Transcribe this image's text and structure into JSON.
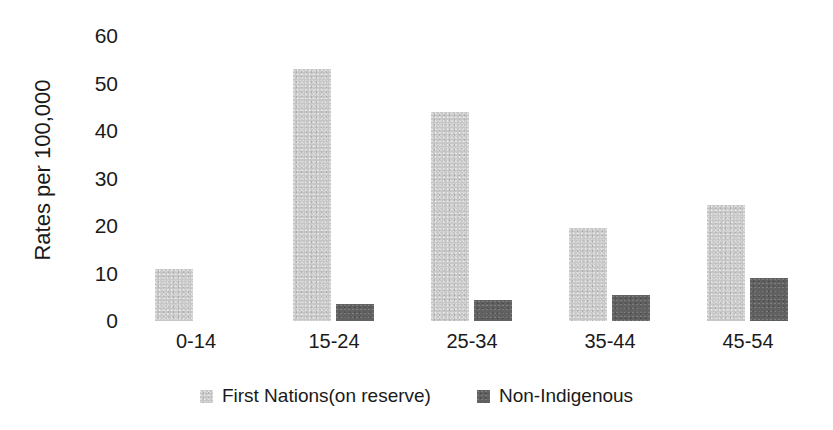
{
  "chart_data": {
    "type": "bar",
    "title": "",
    "subtitle": "",
    "xlabel": "",
    "ylabel": "Rates per 100,000",
    "categories": [
      "0-14",
      "15-24",
      "25-34",
      "35-44",
      "45-54"
    ],
    "series": [
      {
        "name": "First Nations(on reserve)",
        "color": "#c6c6c6",
        "values": [
          11,
          53,
          44,
          19.5,
          24.5
        ]
      },
      {
        "name": "Non-Indigenous",
        "color": "#616161",
        "values": [
          0,
          3.5,
          4.5,
          5.5,
          9
        ]
      }
    ],
    "ylim": [
      0,
      60
    ],
    "ytick_values": [
      0,
      10,
      20,
      30,
      40,
      50,
      60
    ],
    "ytick_labels": [
      "0",
      "10",
      "20",
      "30",
      "40",
      "50",
      "60"
    ],
    "grid": false,
    "legend_position": "bottom",
    "annotations": []
  },
  "axis": {
    "y_title": "Rates per 100,000"
  },
  "legend": {
    "items": [
      {
        "label": "First Nations(on reserve)",
        "color": "#c6c6c6"
      },
      {
        "label": "Non-Indigenous",
        "color": "#616161"
      }
    ]
  }
}
